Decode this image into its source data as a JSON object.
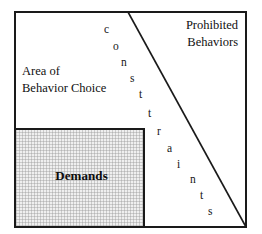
{
  "figure": {
    "background_color": "#ffffff",
    "line_color": "#1a1a1a",
    "shaded_fill_color": "#efefef"
  },
  "regions": {
    "behavior_choice": {
      "line1": "Area of",
      "line2": "Behavior Choice"
    },
    "prohibited": {
      "line1": "Prohibited",
      "line2": "Behaviors"
    },
    "demands": {
      "label": "Demands"
    }
  },
  "constraint_boundary": {
    "word": "constraints",
    "letters": [
      {
        "char": "c",
        "x": 104,
        "y": 24
      },
      {
        "char": "o",
        "x": 113,
        "y": 41
      },
      {
        "char": "n",
        "x": 121,
        "y": 57
      },
      {
        "char": "s",
        "x": 130,
        "y": 73
      },
      {
        "char": "t",
        "x": 139,
        "y": 89
      },
      {
        "char": "t",
        "x": 148,
        "y": 108
      },
      {
        "char": "r",
        "x": 157,
        "y": 126
      },
      {
        "char": "a",
        "x": 167,
        "y": 143
      },
      {
        "char": "i",
        "x": 177,
        "y": 159
      },
      {
        "char": "n",
        "x": 190,
        "y": 174
      },
      {
        "char": "t",
        "x": 200,
        "y": 190
      },
      {
        "char": "s",
        "x": 208,
        "y": 206
      }
    ],
    "line_start": {
      "x": 128,
      "y": 12
    },
    "line_end": {
      "x": 246,
      "y": 227
    }
  }
}
